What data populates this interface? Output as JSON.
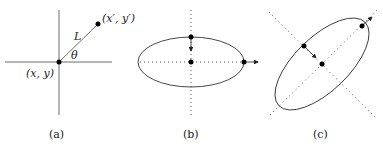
{
  "figure": {
    "panels": [
      {
        "id": "a",
        "caption": "(a)",
        "labels": {
          "origin": "(x, y)",
          "endpoint": "(x′, y′)",
          "length": "L",
          "angle": "θ"
        }
      },
      {
        "id": "b",
        "caption": "(b)"
      },
      {
        "id": "c",
        "caption": "(c)"
      }
    ],
    "colors": {
      "line": "#333333",
      "dot": "#000000",
      "dotted": "#555555"
    }
  }
}
